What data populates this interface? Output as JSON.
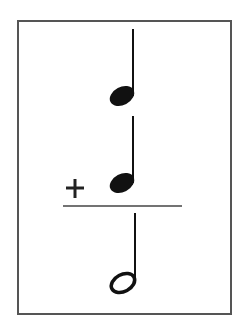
{
  "diagram": {
    "title": "Note value addition",
    "equation": {
      "operands": [
        {
          "symbol": "quarter-note",
          "label": "Quarter note",
          "beats": 1
        },
        {
          "symbol": "quarter-note",
          "label": "Quarter note",
          "beats": 1
        }
      ],
      "operator": "+",
      "result": {
        "symbol": "half-note",
        "label": "Half note",
        "beats": 2
      }
    },
    "colors": {
      "ink": "#111111",
      "border": "#555555",
      "rule": "#444444",
      "background": "#ffffff"
    }
  }
}
